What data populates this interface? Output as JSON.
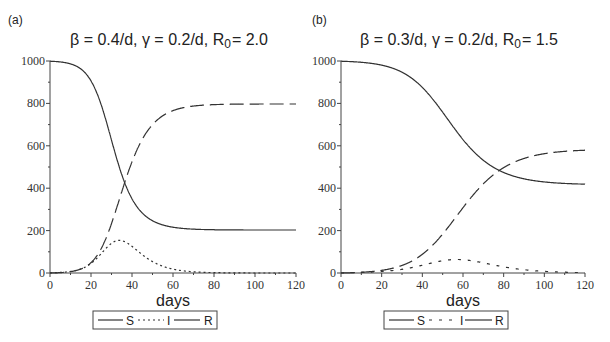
{
  "chart_data": [
    {
      "type": "line",
      "panel": "(a)",
      "title": "β = 0.4/d, γ = 0.2/d, R0 = 2.0",
      "title_parts": {
        "beta": "β = 0.4/d,",
        "gamma": "γ = 0.2/d,",
        "r": "R",
        "r_sub": "0",
        "r_val": "= 2.0"
      },
      "xlabel": "days",
      "ylabel": "",
      "xlim": [
        0,
        120
      ],
      "ylim": [
        0,
        1000
      ],
      "xticks": [
        0,
        20,
        40,
        60,
        80,
        100,
        120
      ],
      "yticks": [
        0,
        200,
        400,
        600,
        800,
        1000
      ],
      "grid": false,
      "legend": {
        "position": "bottom",
        "entries": [
          "S",
          "I",
          "R"
        ]
      },
      "params": {
        "beta": 0.4,
        "gamma": 0.2,
        "N": 1000,
        "I0": 1
      },
      "x": [
        0,
        10,
        20,
        25,
        30,
        35,
        40,
        45,
        50,
        60,
        70,
        80,
        100,
        120
      ],
      "series": [
        {
          "name": "S",
          "style": "solid",
          "values": [
            999,
            985,
            920,
            820,
            640,
            440,
            320,
            260,
            232,
            210,
            205,
            203,
            203,
            203
          ]
        },
        {
          "name": "I",
          "style": "dotted",
          "values": [
            1,
            6,
            40,
            90,
            140,
            153,
            130,
            95,
            62,
            24,
            8,
            3,
            0,
            0
          ]
        },
        {
          "name": "R",
          "style": "dashed",
          "values": [
            0,
            9,
            40,
            90,
            220,
            407,
            550,
            645,
            706,
            766,
            787,
            794,
            797,
            797
          ]
        }
      ]
    },
    {
      "type": "line",
      "panel": "(b)",
      "title": "β = 0.3/d, γ = 0.2/d, R0 = 1.5",
      "title_parts": {
        "beta": "β = 0.3/d,",
        "gamma": "γ = 0.2/d,",
        "r": "R",
        "r_sub": "0",
        "r_val": "= 1.5"
      },
      "xlabel": "days",
      "ylabel": "",
      "xlim": [
        0,
        120
      ],
      "ylim": [
        0,
        1000
      ],
      "xticks": [
        0,
        20,
        40,
        60,
        80,
        100,
        120
      ],
      "yticks": [
        0,
        200,
        400,
        600,
        800,
        1000
      ],
      "grid": false,
      "legend": {
        "position": "bottom",
        "entries": [
          "S",
          "I",
          "R"
        ]
      },
      "params": {
        "beta": 0.3,
        "gamma": 0.2,
        "N": 1000,
        "I0": 1
      },
      "x": [
        0,
        10,
        20,
        30,
        40,
        50,
        60,
        70,
        80,
        90,
        100,
        110,
        120
      ],
      "series": [
        {
          "name": "S",
          "style": "solid",
          "values": [
            999,
            995,
            975,
            930,
            840,
            720,
            600,
            520,
            475,
            450,
            435,
            425,
            420
          ]
        },
        {
          "name": "I",
          "style": "dotted",
          "values": [
            1,
            3,
            10,
            25,
            45,
            60,
            60,
            48,
            33,
            20,
            12,
            6,
            3
          ]
        },
        {
          "name": "R",
          "style": "dashed",
          "values": [
            0,
            2,
            15,
            45,
            115,
            220,
            340,
            432,
            492,
            530,
            553,
            569,
            577
          ]
        }
      ]
    }
  ],
  "panels": [
    {
      "label": "(a)",
      "title_beta": "β = 0.4/d,",
      "title_gamma": "γ = 0.2/d,",
      "title_r": "R",
      "title_r_sub": "0",
      "title_r_val": "= 2.0",
      "xlabel": "days",
      "legend": {
        "s": "S",
        "i": "I",
        "r": "R"
      }
    },
    {
      "label": "(b)",
      "title_beta": "β = 0.3/d,",
      "title_gamma": "γ = 0.2/d,",
      "title_r": "R",
      "title_r_sub": "0",
      "title_r_val": "= 1.5",
      "xlabel": "days",
      "legend": {
        "s": "S",
        "i": "I",
        "r": "R"
      }
    }
  ],
  "colors": {
    "line": "#333333",
    "axis": "#444444",
    "background": "#ffffff"
  }
}
